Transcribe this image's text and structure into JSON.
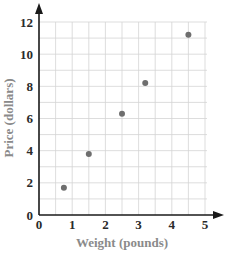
{
  "chart_data": {
    "type": "scatter",
    "title": "",
    "xlabel": "Weight (pounds)",
    "ylabel": "Price (dollars)",
    "xlim": [
      0,
      5
    ],
    "ylim": [
      0,
      12
    ],
    "x_ticks": [
      "0",
      "1",
      "2",
      "3",
      "4",
      "5"
    ],
    "y_ticks": [
      "0",
      "2",
      "4",
      "6",
      "8",
      "10",
      "12"
    ],
    "grid": true,
    "legend": null,
    "points": [
      {
        "x": 0.75,
        "y": 1.7
      },
      {
        "x": 1.5,
        "y": 3.8
      },
      {
        "x": 2.5,
        "y": 6.3
      },
      {
        "x": 3.2,
        "y": 8.2
      },
      {
        "x": 4.5,
        "y": 11.2
      }
    ],
    "point_color": "#6e6e6e",
    "axis_color": "#1a1a1a",
    "grid_color": "#d4d4d4"
  }
}
